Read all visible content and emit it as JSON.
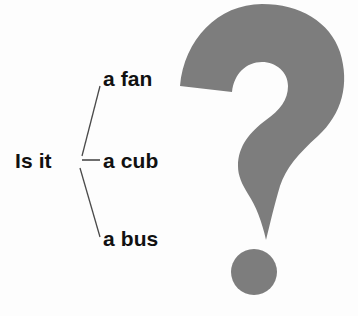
{
  "page": {
    "background_color": "#fdfdfd",
    "width": 358,
    "height": 316
  },
  "diagram": {
    "stem": "Is it",
    "options": [
      {
        "label": "a fan",
        "branch": "up"
      },
      {
        "label": "a cub",
        "branch": "straight"
      },
      {
        "label": "a bus",
        "branch": "down"
      }
    ],
    "line_color": "#4a4a4a",
    "text_color": "#111111"
  },
  "illustration": {
    "icon": "question-mark-icon",
    "color": "#7d7d7d",
    "dot_color": "#7d7d7d"
  }
}
